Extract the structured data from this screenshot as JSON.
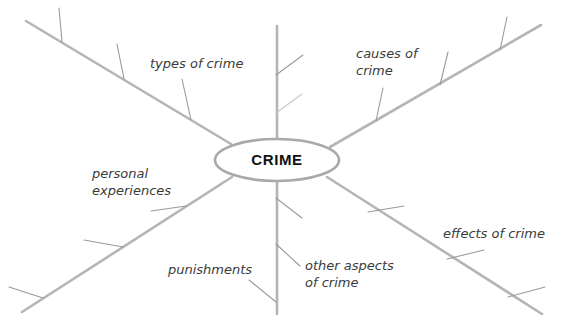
{
  "diagram": {
    "type": "mind-map",
    "title": "CRIME",
    "center": {
      "label": "CRIME",
      "shape": "ellipse",
      "cx": 277,
      "cy": 160,
      "rx": 62,
      "ry": 21,
      "fill": "#ffffff",
      "stroke": "#a9a9a9"
    },
    "colors": {
      "branch": "#b5b5b5",
      "twig": "#9a9a9a",
      "twig_faint": "#c9c9c9",
      "text": "#3a3a3a",
      "center_text": "#111111",
      "background": "#ffffff"
    },
    "branch_count": 6,
    "branches": [
      {
        "id": "types-of-crime",
        "label": "types of crime",
        "label_lines": [
          "types of crime"
        ],
        "direction": "upper-left",
        "label_x": 150,
        "label_y": 68,
        "line": {
          "x1": 231,
          "y1": 144,
          "x2": 26,
          "y2": 21
        },
        "twigs": [
          {
            "x1": 191,
            "y1": 120,
            "x2": 182,
            "y2": 79
          },
          {
            "x1": 124,
            "y1": 79,
            "x2": 117,
            "y2": 44
          },
          {
            "x1": 62,
            "y1": 42,
            "x2": 59,
            "y2": 8
          }
        ]
      },
      {
        "id": "causes-of-crime",
        "label": "causes of crime",
        "label_lines": [
          "causes of",
          "crime"
        ],
        "direction": "upper-right",
        "label_x": 356,
        "label_y": 58,
        "line": {
          "x1": 330,
          "y1": 147,
          "x2": 541,
          "y2": 25
        },
        "twigs": [
          {
            "x1": 376,
            "y1": 121,
            "x2": 383,
            "y2": 88
          },
          {
            "x1": 440,
            "y1": 85,
            "x2": 448,
            "y2": 52
          },
          {
            "x1": 500,
            "y1": 50,
            "x2": 507,
            "y2": 17
          }
        ]
      },
      {
        "id": "personal-experiences",
        "label": "personal experiences",
        "label_lines": [
          "personal",
          "experiences"
        ],
        "direction": "lower-left",
        "label_x": 92,
        "label_y": 178,
        "line": {
          "x1": 232,
          "y1": 177,
          "x2": 22,
          "y2": 312
        },
        "twigs": [
          {
            "x1": 186,
            "y1": 206,
            "x2": 151,
            "y2": 211
          },
          {
            "x1": 123,
            "y1": 247,
            "x2": 84,
            "y2": 240
          },
          {
            "x1": 43,
            "y1": 298,
            "x2": 9,
            "y2": 287
          }
        ]
      },
      {
        "id": "effects-of-crime",
        "label": "effects of crime",
        "label_lines": [
          "effects of crime"
        ],
        "direction": "lower-right",
        "label_x": 443,
        "label_y": 238,
        "line": {
          "x1": 327,
          "y1": 177,
          "x2": 542,
          "y2": 314
        },
        "twigs": [
          {
            "x1": 368,
            "y1": 212,
            "x2": 404,
            "y2": 206
          },
          {
            "x1": 447,
            "y1": 259,
            "x2": 484,
            "y2": 250
          },
          {
            "x1": 508,
            "y1": 297,
            "x2": 545,
            "y2": 287
          }
        ]
      },
      {
        "id": "other-aspects-of-crime",
        "label": "other aspects of crime",
        "label_lines": [
          "other aspects",
          "of crime"
        ],
        "direction": "down",
        "label_x": 305,
        "label_y": 270,
        "line": {
          "x1": 277,
          "y1": 181,
          "x2": 277,
          "y2": 314
        },
        "twigs": [
          {
            "x1": 276,
            "y1": 198,
            "x2": 302,
            "y2": 218
          },
          {
            "x1": 276,
            "y1": 244,
            "x2": 300,
            "y2": 266
          }
        ]
      },
      {
        "id": "punishments",
        "label": "punishments",
        "label_lines": [
          "punishments"
        ],
        "direction": "down-label-left",
        "label_x": 168,
        "label_y": 274,
        "line": {
          "x1": 277,
          "y1": 181,
          "x2": 277,
          "y2": 314
        },
        "twigs": [
          {
            "x1": 276,
            "y1": 302,
            "x2": 249,
            "y2": 280
          }
        ]
      },
      {
        "id": "upper-vertical-stem",
        "label": "",
        "label_lines": [],
        "direction": "up",
        "line": {
          "x1": 277,
          "y1": 139,
          "x2": 277,
          "y2": 26
        },
        "twigs": [
          {
            "x1": 276,
            "y1": 75,
            "x2": 303,
            "y2": 55
          },
          {
            "x1": 276,
            "y1": 113,
            "x2": 302,
            "y2": 94
          }
        ]
      }
    ]
  }
}
